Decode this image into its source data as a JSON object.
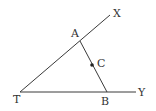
{
  "diagram": {
    "type": "geometry",
    "points": {
      "T": {
        "label": "T",
        "x": 20,
        "y": 92,
        "label_x": 13,
        "label_y": 103
      },
      "X": {
        "label": "X",
        "x": 110,
        "y": 15,
        "label_x": 113,
        "label_y": 17
      },
      "Y": {
        "label": "Y",
        "x": 136,
        "y": 92,
        "label_x": 138,
        "label_y": 96
      },
      "A": {
        "label": "A",
        "x": 80,
        "y": 41,
        "label_x": 71,
        "label_y": 37
      },
      "B": {
        "label": "B",
        "x": 107,
        "y": 92,
        "label_x": 101,
        "label_y": 105
      },
      "C": {
        "label": "C",
        "x": 92,
        "y": 65,
        "label_x": 97,
        "label_y": 67
      }
    },
    "segments": [
      {
        "from": "T",
        "to": "X",
        "name": "ray-TX"
      },
      {
        "from": "T",
        "to": "Y",
        "name": "ray-TY"
      },
      {
        "from": "A",
        "to": "B",
        "name": "segment-AB"
      }
    ],
    "marked_points": [
      "C"
    ],
    "colors": {
      "line": "#3a3a3a",
      "text": "#333333",
      "background": "#ffffff"
    }
  }
}
